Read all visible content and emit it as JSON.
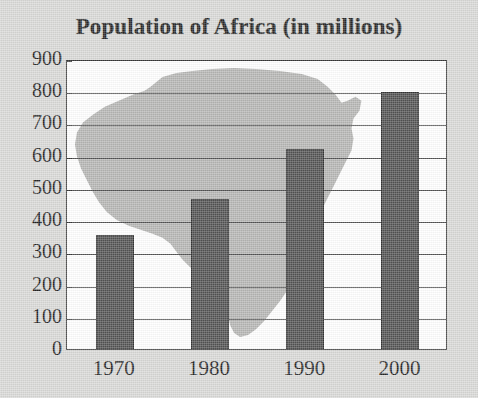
{
  "chart_data": {
    "type": "bar",
    "title": "Population of Africa (in millions)",
    "xlabel": "",
    "ylabel": "",
    "categories": [
      "1970",
      "1980",
      "1990",
      "2000"
    ],
    "values": [
      361,
      472,
      626,
      805
    ],
    "data_labels": [
      "361",
      "472",
      "626",
      "805"
    ],
    "ylim": [
      0,
      900
    ],
    "y_ticks": [
      0,
      100,
      200,
      300,
      400,
      500,
      600,
      700,
      800,
      900
    ],
    "y_tick_labels": [
      "900",
      "800",
      "700",
      "600",
      "500",
      "400",
      "300",
      "200",
      "100",
      "0"
    ],
    "grid": true,
    "legend": "none",
    "background_image": "africa-map-silhouette",
    "colors": {
      "bar_fill": "#4a4a4a",
      "bar_outline": "#2a2a2a",
      "plot_background": "#ffffff",
      "canvas_background": "#d8d8d6",
      "watermark": "#b0b0ae",
      "gridline": "#4a4a4a",
      "axis": "#2c2c2c",
      "text": "#1a1a1a"
    }
  }
}
